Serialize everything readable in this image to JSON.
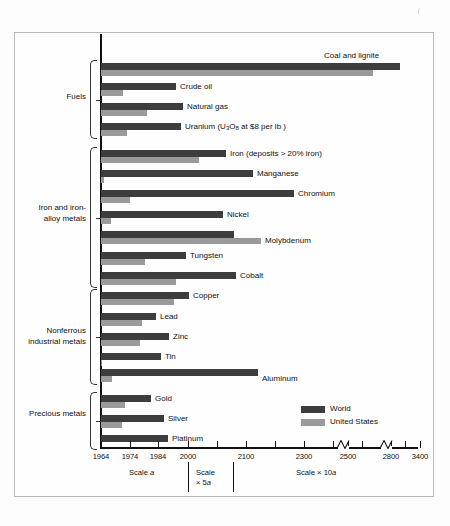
{
  "figure": {
    "background": "#fdfdfd",
    "frame_color": "#b9b9b9"
  },
  "legend": {
    "position": "inside-bottom-right",
    "items": [
      {
        "label": "World",
        "color": "#3d3d3d",
        "key": "world"
      },
      {
        "label": "United States",
        "color": "#9a9a9a",
        "key": "us"
      }
    ]
  },
  "axis": {
    "ticks": [
      {
        "label": "1964",
        "x": 101
      },
      {
        "label": "1974",
        "x": 130
      },
      {
        "label": "1984",
        "x": 158
      },
      {
        "label": "2000",
        "x": 188
      },
      {
        "label": "",
        "x": 217
      },
      {
        "label": "2100",
        "x": 246
      },
      {
        "label": "",
        "x": 275
      },
      {
        "label": "2300",
        "x": 304
      },
      {
        "label": "",
        "x": 333
      },
      {
        "label": "2500",
        "x": 348
      },
      {
        "label": "",
        "x": 362
      },
      {
        "label": "2800",
        "x": 391
      },
      {
        "label": "",
        "x": 405
      },
      {
        "label": "3400",
        "x": 420
      }
    ],
    "scale_bands": [
      {
        "label": "Scale a",
        "italic_tail": "a"
      },
      {
        "label": "Scale\n× 5a"
      },
      {
        "label": "Scale × 10a"
      }
    ]
  },
  "groups": [
    {
      "label": "Fuels",
      "name": "fuels"
    },
    {
      "label": "Iron and iron-\nalloy metals",
      "name": "iron-and-iron-alloy-metals"
    },
    {
      "label": "Nonferrous\nindustrial metals",
      "name": "nonferrous-industrial-metals"
    },
    {
      "label": "Precious metals",
      "name": "precious-metals"
    }
  ],
  "chart_data": {
    "type": "bar",
    "orientation": "horizontal",
    "title": "",
    "xlabel": "Year of exhaustion",
    "ylabel": "",
    "grid": false,
    "legend_position": "inside-bottom-right",
    "series": [
      {
        "name": "World",
        "color": "#3d3d3d"
      },
      {
        "name": "United States",
        "color": "#9a9a9a"
      }
    ],
    "axis_note": "Piecewise axis: 1964-2000 at Scale a, 2000-2100 at Scale x 5a, 2100-3400 at Scale x 10a; breaks drawn between 2500-2800 and 2800-3400",
    "categories": [
      "Coal and lignite",
      "Crude oil",
      "Natural gas",
      "Uranium (U3O8 at $8 per lb )",
      "Iron (deposits > 20% iron)",
      "Manganese",
      "Chromium",
      "Nickel",
      "Molybdenum",
      "Tungsten",
      "Cobalt",
      "Copper",
      "Lead",
      "Zinc",
      "Tin",
      "Aluminum",
      "Gold",
      "Silver",
      "Platinum"
    ],
    "rows": [
      {
        "label": "Coal and lignite",
        "label_html": "Coal and lignite",
        "group": "fuels",
        "world_x": 400,
        "us_x": 373,
        "label_x": 324,
        "label_y": 52,
        "y": 63
      },
      {
        "label": "Crude oil",
        "label_html": "Crude oil",
        "group": "fuels",
        "world_x": 176,
        "us_x": 123,
        "label_x": 180,
        "label_y": 83,
        "y": 83
      },
      {
        "label": "Natural gas",
        "label_html": "Natural gas",
        "group": "fuels",
        "world_x": 183,
        "us_x": 147,
        "label_x": 187,
        "label_y": 103,
        "y": 103
      },
      {
        "label": "Uranium (U3O8 at $8 per lb )",
        "label_html": "Uranium (U<sub>3</sub>O<sub>8</sub> at $8 per lb )",
        "group": "fuels",
        "world_x": 181,
        "us_x": 127,
        "label_x": 185,
        "label_y": 123,
        "y": 123
      },
      {
        "label": "Iron (deposits > 20% iron)",
        "label_html": "Iron (deposits &gt; 20% iron)",
        "group": "iron",
        "world_x": 226,
        "us_x": 199,
        "label_x": 230,
        "label_y": 150,
        "y": 150
      },
      {
        "label": "Manganese",
        "label_html": "Manganese",
        "group": "iron",
        "world_x": 253,
        "us_x": 104,
        "label_x": 257,
        "label_y": 170,
        "y": 170
      },
      {
        "label": "Chromium",
        "label_html": "Chromium",
        "group": "iron",
        "world_x": 294,
        "us_x": 130,
        "label_x": 298,
        "label_y": 190,
        "y": 190
      },
      {
        "label": "Nickel",
        "label_html": "Nickel",
        "group": "iron",
        "world_x": 223,
        "us_x": 111,
        "label_x": 227,
        "label_y": 211,
        "y": 211
      },
      {
        "label": "Molybdenum",
        "label_html": "Molybdenum",
        "group": "iron",
        "world_x": 234,
        "us_x": 261,
        "label_x": 265,
        "label_y": 237,
        "y": 231
      },
      {
        "label": "Tungsten",
        "label_html": "Tungsten",
        "group": "iron",
        "world_x": 186,
        "us_x": 145,
        "label_x": 190,
        "label_y": 252,
        "y": 252
      },
      {
        "label": "Cobalt",
        "label_html": "Cobalt",
        "group": "iron",
        "world_x": 236,
        "us_x": 176,
        "label_x": 240,
        "label_y": 272,
        "y": 272
      },
      {
        "label": "Copper",
        "label_html": "Copper",
        "group": "nonferrous",
        "world_x": 189,
        "us_x": 174,
        "label_x": 193,
        "label_y": 292,
        "y": 292
      },
      {
        "label": "Lead",
        "label_html": "Lead",
        "group": "nonferrous",
        "world_x": 156,
        "us_x": 142,
        "label_x": 160,
        "label_y": 313,
        "y": 313
      },
      {
        "label": "Zinc",
        "label_html": "Zinc",
        "group": "nonferrous",
        "world_x": 169,
        "us_x": 140,
        "label_x": 173,
        "label_y": 333,
        "y": 333
      },
      {
        "label": "Tin",
        "label_html": "Tin",
        "group": "nonferrous",
        "world_x": 161,
        "us_x": 101,
        "label_x": 165,
        "label_y": 353,
        "y": 353
      },
      {
        "label": "Aluminum",
        "label_html": "Aluminum",
        "group": "nonferrous",
        "world_x": 258,
        "us_x": 112,
        "label_x": 262,
        "label_y": 375,
        "y": 369
      },
      {
        "label": "Gold",
        "label_html": "Gold",
        "group": "precious",
        "world_x": 151,
        "us_x": 125,
        "label_x": 155,
        "label_y": 395,
        "y": 395
      },
      {
        "label": "Silver",
        "label_html": "Silver",
        "group": "precious",
        "world_x": 164,
        "us_x": 122,
        "label_x": 168,
        "label_y": 415,
        "y": 415
      },
      {
        "label": "Platinum",
        "label_html": "Platinum",
        "group": "precious",
        "world_x": 168,
        "us_x": 101,
        "label_x": 172,
        "label_y": 435,
        "y": 435
      }
    ]
  }
}
